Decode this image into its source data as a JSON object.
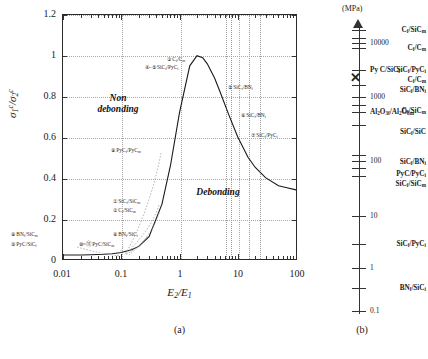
{
  "figure": {
    "panel_a_caption": "(a)",
    "panel_b_caption": "(b)"
  },
  "chart_data": {
    "type": "line",
    "title": "",
    "xlabel": "E2/E1",
    "ylabel": "sigma_1^c / sigma_2^c",
    "xscale": "log",
    "xlim": [
      0.01,
      100
    ],
    "ylim": [
      0,
      1.2
    ],
    "grid": true,
    "xticks": [
      "0.01",
      "0.1",
      "1",
      "10",
      "100"
    ],
    "yticks": [
      "0",
      "0.2",
      "0.4",
      "0.6",
      "0.8",
      "1",
      "1.2"
    ],
    "regions": [
      {
        "label": "Non\ndebonding",
        "x": 0.1,
        "y": 0.68
      },
      {
        "label": "Debonding",
        "x": 6.0,
        "y": 0.3
      }
    ],
    "series": [
      {
        "name": "debonding criterion curve",
        "x": [
          0.01,
          0.02,
          0.03,
          0.05,
          0.07,
          0.1,
          0.15,
          0.2,
          0.3,
          0.5,
          0.7,
          1.0,
          1.5,
          2.0,
          2.5,
          3.0,
          4.0,
          5.0,
          7.0,
          10.0,
          15.0,
          20.0,
          30.0,
          50.0,
          70.0,
          100.0
        ],
        "y": [
          0.02,
          0.02,
          0.021,
          0.023,
          0.026,
          0.032,
          0.045,
          0.062,
          0.11,
          0.27,
          0.46,
          0.72,
          0.95,
          1.0,
          0.99,
          0.96,
          0.89,
          0.82,
          0.71,
          0.6,
          0.5,
          0.45,
          0.4,
          0.36,
          0.35,
          0.34
        ]
      }
    ],
    "points": [
      {
        "id": "1",
        "label": "SiC_f/SiC_m",
        "x": 0.3,
        "y": 0.255
      },
      {
        "id": "2",
        "label": "C_f/SiC_m",
        "x": 0.3,
        "y": 0.225
      },
      {
        "id": "3",
        "label": "C_f/C_m",
        "x": 2.0,
        "y": 0.9
      },
      {
        "id": "4",
        "label": "SiC_f/PyC_i",
        "x": 1.6,
        "y": 0.845
      },
      {
        "id": "5",
        "label": "SiC_f/BN_i",
        "x": 9.0,
        "y": 0.775
      },
      {
        "id": "6",
        "label": "SiC_f/BN_i",
        "x": 13.0,
        "y": 0.66
      },
      {
        "id": "7",
        "label": "SiC_f/PyC_i",
        "x": 22.0,
        "y": 0.585
      },
      {
        "id": "6b",
        "label": "BN_f/SiC_i",
        "x": 0.3,
        "y": 0.165
      },
      {
        "id": "8",
        "label": "BN_f/SiC_m",
        "x": 0.025,
        "y": 0.165
      },
      {
        "id": "9",
        "label": "PyC/SiC_f",
        "x": 0.025,
        "y": 0.12
      },
      {
        "id": "10-11",
        "label": "PyC/SiC_m",
        "x": 0.12,
        "y": 0.12
      },
      {
        "id": "12",
        "label": "PyC_f/PyC_m",
        "x": 0.3,
        "y": 0.545
      }
    ]
  },
  "scale_b": {
    "unit_label": "(MPa)",
    "scale_type": "log",
    "tick_values": [
      "10000",
      "1000",
      "100",
      "10",
      "1",
      "0.1"
    ],
    "left_entries": [
      {
        "label": "C_f/SiC_m"
      },
      {
        "label": "C_f/C_m"
      },
      {
        "label": "SiC_f/PyC_i"
      },
      {
        "label": "C_f/C_m"
      },
      {
        "label": "SiC_f/BN_i"
      },
      {
        "label": "C_f/SiC_m"
      },
      {
        "label": "SiC_f/SiC"
      },
      {
        "label": "SiC_f/BN_i"
      },
      {
        "label": "PyC/PyC_i"
      },
      {
        "label": "SiC_f/SiC_m"
      },
      {
        "label": "SiC_f/PyC_i"
      },
      {
        "label": "BN_f/SiC_i"
      }
    ],
    "right_entries": [
      {
        "label": "Py C/SiC_f"
      },
      {
        "label": "Al2O3f/Al2O3m"
      }
    ]
  }
}
